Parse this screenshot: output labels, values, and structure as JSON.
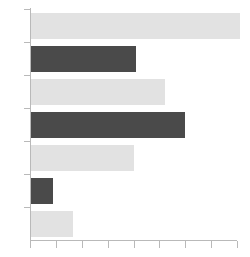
{
  "chart_data": {
    "type": "bar",
    "orientation": "horizontal",
    "title": "",
    "subtitle": "",
    "xlabel": "",
    "ylabel": "",
    "categories": [
      "1",
      "2",
      "3",
      "4",
      "5",
      "6",
      "7"
    ],
    "values": [
      8.1,
      4.1,
      5.2,
      6.0,
      4.0,
      0.9,
      1.65
    ],
    "bar_colors": [
      "#e2e2e2",
      "#4a4a4a",
      "#e2e2e2",
      "#4a4a4a",
      "#e2e2e2",
      "#4a4a4a",
      "#e2e2e2"
    ],
    "xlim": [
      0,
      8
    ],
    "ylim": [
      0,
      7
    ],
    "xticks": [
      0,
      1,
      2,
      3,
      4,
      5,
      6,
      7,
      8
    ],
    "xtick_labels": [
      "",
      "",
      "",
      "",
      "",
      "",
      "",
      "",
      ""
    ],
    "ytick_labels": [
      "",
      "",
      "",
      "",
      "",
      "",
      ""
    ],
    "grid": false,
    "legend": null,
    "legend_position": "none",
    "annotations": []
  },
  "style": {
    "background": "#ffffff",
    "axis_color": "#b9b9b9",
    "light_bar_color": "#e2e2e2",
    "dark_bar_color": "#4a4a4a"
  },
  "geometry": {
    "width": 250,
    "height": 257,
    "plot_left": 30,
    "plot_right": 237,
    "plot_top": 9,
    "plot_bottom": 240,
    "bar_height": 26,
    "bar_gap": 6,
    "tick_length": 7
  }
}
